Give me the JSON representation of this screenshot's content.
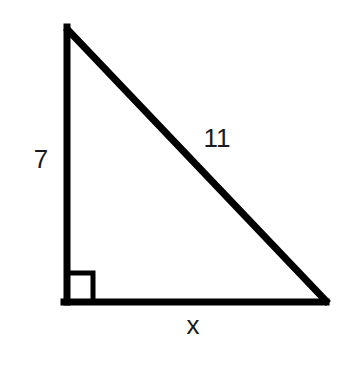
{
  "figure": {
    "type": "right-triangle",
    "vertices": {
      "top": {
        "x": 67,
        "y": 30
      },
      "bottom_left": {
        "x": 67,
        "y": 302
      },
      "bottom_right": {
        "x": 325,
        "y": 302
      }
    },
    "right_angle_marker": {
      "x": 67,
      "y": 273,
      "size": 28
    },
    "stroke_color": "#000000",
    "stroke_width": 7
  },
  "labels": {
    "left_leg": "7",
    "hypotenuse": "11",
    "bottom_leg": "x"
  }
}
